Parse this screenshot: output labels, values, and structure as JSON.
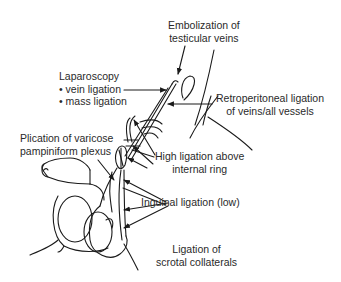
{
  "diagram": {
    "type": "anatomical-illustration",
    "line_color": "#1a1a1a",
    "text_color": "#2a2a2a",
    "labels": {
      "embolization": {
        "line1": "Embolization of",
        "line2": "testicular veins"
      },
      "laparoscopy": {
        "title": "Laparoscopy",
        "item1": "• vein ligation",
        "item2": "• mass ligation"
      },
      "retroperitoneal": {
        "line1": "Retroperitoneal ligation",
        "line2": "of veins/all vessels"
      },
      "plication": {
        "line1": "Plication of varicose",
        "line2": "pampiniform plexus"
      },
      "high_ligation": {
        "line1": "High ligation above",
        "line2": "internal ring"
      },
      "inguinal": {
        "line1": "Inguinal ligation (low)"
      },
      "scrotal": {
        "line1": "Ligation of",
        "line2": "scrotal collaterals"
      }
    }
  }
}
